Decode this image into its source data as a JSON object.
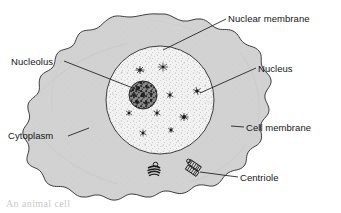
{
  "figure": {
    "type": "labeled-biological-diagram",
    "background_color": "#ffffff",
    "line_color": "#1a1a1a",
    "cytoplasm_color": "#d2d2d2",
    "nucleus_color": "#f0f0f0",
    "nucleolus_color": "#4a4a4a",
    "text_color": "#141414"
  },
  "labels": {
    "nuclear_membrane": "Nuclear membrane",
    "nucleolus": "Nucleolus",
    "nucleus": "Nucleus",
    "cell_membrane": "Cell membrane",
    "cytoplasm": "Cytoplasm",
    "centriole": "Centriole"
  },
  "caption": {
    "partial_cut_off_text": "An animal cell"
  },
  "parts": [
    {
      "name": "cell-membrane",
      "label": "Cell membrane",
      "side": "right"
    },
    {
      "name": "cytoplasm",
      "label": "Cytoplasm",
      "side": "left"
    },
    {
      "name": "nuclear-membrane",
      "label": "Nuclear membrane",
      "side": "top-right"
    },
    {
      "name": "nucleus",
      "label": "Nucleus",
      "side": "right"
    },
    {
      "name": "nucleolus",
      "label": "Nucleolus",
      "side": "left"
    },
    {
      "name": "centriole",
      "label": "Centriole",
      "side": "bottom-right"
    }
  ]
}
